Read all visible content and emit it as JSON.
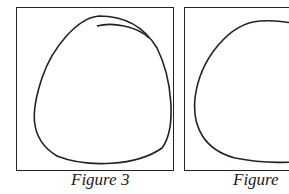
{
  "figures": [
    {
      "id": "figure-3",
      "caption": "Figure 3",
      "shape": "closed-loop-rounded-triangle"
    },
    {
      "id": "figure-4",
      "caption": "Figure 4",
      "shape": "closed-loop-rounded-dome"
    }
  ],
  "colors": {
    "stroke": "#222222",
    "background": "#ffffff"
  }
}
